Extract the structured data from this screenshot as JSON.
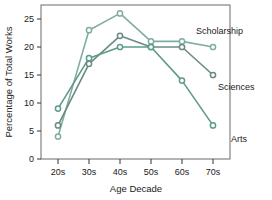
{
  "chart_data": {
    "type": "line",
    "title": "",
    "xlabel": "Age Decade",
    "ylabel": "Percentage of Total Works",
    "categories": [
      "20s",
      "30s",
      "40s",
      "50s",
      "60s",
      "70s"
    ],
    "x_tick_labels": [
      "20s",
      "30s",
      "40s",
      "50s",
      "60s",
      "70s"
    ],
    "y_tick_labels": [
      "0",
      "5",
      "10",
      "15",
      "20",
      "25"
    ],
    "y_ticks": [
      0,
      5,
      10,
      15,
      20,
      25
    ],
    "ylim": [
      0,
      27.5
    ],
    "grid": false,
    "legend_position": "right-inline-labels",
    "series": [
      {
        "name": "Scholarship",
        "color": "#7fada3",
        "values": [
          4,
          23,
          26,
          21,
          21,
          20
        ],
        "label": "Scholarship"
      },
      {
        "name": "Sciences",
        "color": "#6b8a83",
        "values": [
          6,
          17,
          22,
          20,
          20,
          15
        ],
        "label": "Sciences"
      },
      {
        "name": "Arts",
        "color": "#5d9b8c",
        "values": [
          9,
          18,
          20,
          20,
          14,
          6
        ],
        "label": "Arts"
      }
    ],
    "annotations": [
      {
        "text": "Scholarship",
        "series": "Scholarship"
      },
      {
        "text": "Sciences",
        "series": "Sciences"
      },
      {
        "text": "Arts",
        "series": "Arts"
      }
    ]
  },
  "axes": {
    "frame_color": "#555555",
    "tick_color": "#333333"
  }
}
